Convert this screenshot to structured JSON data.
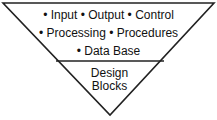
{
  "diagram": {
    "top_section": {
      "lines": [
        "• Input • Output • Control",
        "• Processing • Procedures",
        "• Data Base"
      ]
    },
    "bottom_section": {
      "lines": [
        "Design",
        "Blocks"
      ]
    },
    "colors": {
      "stroke": "#222222",
      "background": "#ffffff"
    }
  }
}
